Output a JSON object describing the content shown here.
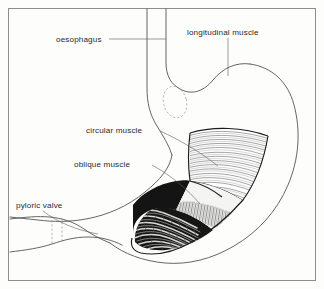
{
  "figure": {
    "background_color": "#fdfdfc",
    "border_color": "#8d8d8d",
    "ink_color": "#4a4a4a",
    "label_color": "#2a2a2a"
  },
  "labels": {
    "oesophagus": "oesophagus",
    "longitudinal_muscle": "longitudinal muscle",
    "circular_muscle": "circular muscle",
    "oblique_muscle": "oblique muscle",
    "pyloric_valve": "pyloric valve"
  },
  "layers": [
    {
      "name": "longitudinal muscle",
      "position": "outermost",
      "texture": "long flowing parallel strokes",
      "fill": "#ffffff"
    },
    {
      "name": "circular muscle",
      "position": "middle",
      "texture": "dense short vertical hatching",
      "fill": "#f2f2f2"
    },
    {
      "name": "oblique muscle",
      "position": "innermost",
      "texture": "dark wavy mottled rugae",
      "fill": "#111111"
    }
  ],
  "structures": [
    "oesophagus",
    "fundus",
    "body",
    "greater curvature",
    "lesser curvature",
    "pyloric antrum",
    "pyloric valve",
    "duodenum",
    "cardiac sphincter region"
  ]
}
